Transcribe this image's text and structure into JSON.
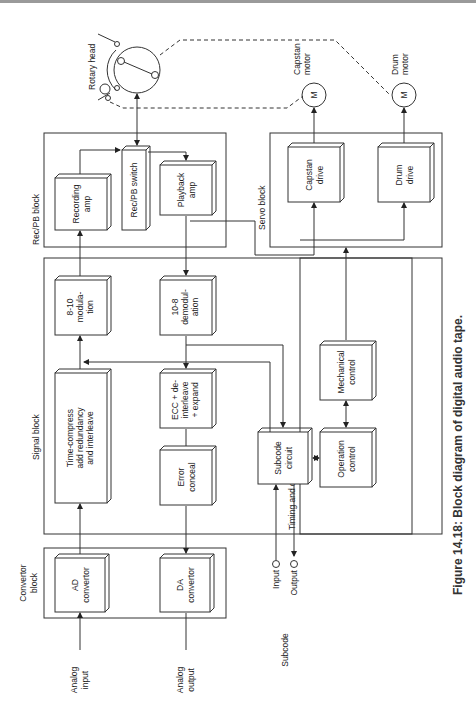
{
  "figure": {
    "caption": "Figure 14.18: Block diagram of digital audio tape."
  },
  "blocks": {
    "convertor": "Convertor block",
    "convertor_l1": "Convertor",
    "convertor_l2": "block",
    "signal": "Signal block",
    "recpb": "Rec/PB block",
    "servo": "Servo block",
    "timing": "Timing and control block"
  },
  "boxes": {
    "ad": [
      "AD",
      "convertor"
    ],
    "da": [
      "DA",
      "convertor"
    ],
    "timecompress": [
      "Time-compress",
      "add redundancy",
      "and interleave"
    ],
    "errorconceal": [
      "Error",
      "conceal"
    ],
    "ecc": [
      "ECC + de-",
      "interleave",
      "+ expand"
    ],
    "mod810": [
      "8-10",
      "modula-",
      "tion"
    ],
    "demod108": [
      "10-8",
      "demodul-",
      "ation"
    ],
    "subcode": [
      "Subcode",
      "circuit"
    ],
    "recamp": [
      "Recording",
      "amp"
    ],
    "recpbswitch": [
      "Rec/PB switch"
    ],
    "pbamp": [
      "Playback",
      "amp"
    ],
    "cosine": [
      "Cosine",
      "equalizer"
    ],
    "atf": [
      "ATF"
    ],
    "capstandrive": [
      "Capstan",
      "drive"
    ],
    "drumdrive": [
      "Drum",
      "drive"
    ],
    "mechanical": [
      "Mechanical",
      "control"
    ],
    "operation": [
      "Operation",
      "control"
    ]
  },
  "labels": {
    "analog_input": [
      "Analog",
      "input"
    ],
    "analog_output": [
      "Analog",
      "output"
    ],
    "subcode": "Subcode",
    "sub_input": "Input",
    "sub_output": "Output",
    "rotary_head": "Rotary head",
    "capstan_motor": [
      "Capstan",
      "motor"
    ],
    "drum_motor": [
      "Drum",
      "motor"
    ],
    "motor_symbol": "M"
  }
}
